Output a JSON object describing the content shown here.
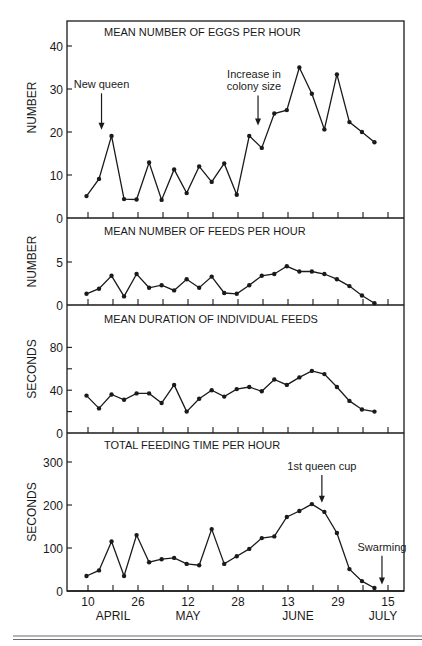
{
  "figure": {
    "bottom_rule_color": "#6b6b6b",
    "ink_color": "#1a1a1a"
  },
  "chart_data": [
    {
      "type": "line",
      "title": "MEAN NUMBER OF EGGS PER HOUR",
      "ylabel": "NUMBER",
      "xlabel": "",
      "ylim": [
        0,
        46
      ],
      "yticks": [
        0,
        10,
        20,
        30,
        40
      ],
      "x_index": [
        0,
        1,
        2,
        3,
        4,
        5,
        6,
        7,
        8,
        9,
        10,
        11,
        12,
        13,
        14,
        15,
        16,
        17,
        18,
        19,
        20,
        21,
        22,
        23
      ],
      "values": [
        5.1,
        9.1,
        19.1,
        4.4,
        4.3,
        12.9,
        4.2,
        11.3,
        5.8,
        12.0,
        8.4,
        12.7,
        5.4,
        19.1,
        16.3,
        24.3,
        25.1,
        35.0,
        28.9,
        20.6,
        33.4,
        22.3,
        20.0,
        17.6
      ],
      "annotations": [
        {
          "text": [
            "New queen"
          ],
          "arrow_at_index": 1.2,
          "arrow_from": 29,
          "arrow_to": 20.5
        },
        {
          "text": [
            "Increase in",
            "colony size"
          ],
          "arrow_at_index": 13.7,
          "arrow_from": 28.5,
          "arrow_to": 21.5
        }
      ]
    },
    {
      "type": "line",
      "title": "MEAN NUMBER OF FEEDS PER HOUR",
      "ylabel": "NUMBER",
      "xlabel": "",
      "ylim": [
        0,
        10
      ],
      "yticks": [
        0,
        5
      ],
      "x_index": [
        0,
        1,
        2,
        3,
        4,
        5,
        6,
        7,
        8,
        9,
        10,
        11,
        12,
        13,
        14,
        15,
        16,
        17,
        18,
        19,
        20,
        21,
        22,
        23
      ],
      "values": [
        1.3,
        1.9,
        3.4,
        1.0,
        3.6,
        2.0,
        2.3,
        1.7,
        3.0,
        2.0,
        3.3,
        1.4,
        1.3,
        2.3,
        3.4,
        3.6,
        4.5,
        3.9,
        3.9,
        3.6,
        3.0,
        2.2,
        1.1,
        0.2
      ],
      "annotations": []
    },
    {
      "type": "line",
      "title": "MEAN DURATION OF INDIVIDUAL FEEDS",
      "ylabel": "SECONDS",
      "xlabel": "",
      "ylim": [
        0,
        120
      ],
      "yticks": [
        0,
        40,
        80
      ],
      "minor_yticks": [
        20,
        60
      ],
      "x_index": [
        0,
        1,
        2,
        3,
        4,
        5,
        6,
        7,
        8,
        9,
        10,
        11,
        12,
        13,
        14,
        15,
        16,
        17,
        18,
        19,
        20,
        21,
        22,
        23
      ],
      "values": [
        35,
        23,
        36,
        31,
        37,
        37,
        28,
        45,
        20,
        32,
        40,
        34,
        41,
        43,
        39,
        50,
        45,
        52,
        58,
        55,
        43,
        30,
        22,
        20
      ],
      "annotations": []
    },
    {
      "type": "line",
      "title": "TOTAL FEEDING TIME PER HOUR",
      "ylabel": "SECONDS",
      "xlabel": "",
      "ylim": [
        0,
        370
      ],
      "yticks": [
        0,
        100,
        200,
        300
      ],
      "x_index": [
        0,
        1,
        2,
        3,
        4,
        5,
        6,
        7,
        8,
        9,
        10,
        11,
        12,
        13,
        14,
        15,
        16,
        17,
        18,
        19,
        20,
        21,
        22,
        23
      ],
      "values": [
        35,
        48,
        115,
        35,
        130,
        67,
        74,
        77,
        63,
        60,
        144,
        63,
        81,
        98,
        123,
        127,
        172,
        186,
        202,
        184,
        135,
        51,
        23,
        7
      ],
      "annotations": [
        {
          "text": [
            "1st queen cup"
          ],
          "arrow_at_index": 18.8,
          "arrow_from": 270,
          "arrow_to": 205
        },
        {
          "text": [
            "Swarming"
          ],
          "arrow_at_index": 23.6,
          "arrow_from": 82,
          "arrow_to": 15
        }
      ]
    }
  ],
  "x_axis": {
    "tick_count": 13,
    "labels": [
      {
        "tick": 0,
        "day": "10",
        "month": "APRIL"
      },
      {
        "tick": 2,
        "day": "26",
        "month": ""
      },
      {
        "tick": 4,
        "day": "12",
        "month": "MAY"
      },
      {
        "tick": 6,
        "day": "28",
        "month": ""
      },
      {
        "tick": 8,
        "day": "13",
        "month": "JUNE"
      },
      {
        "tick": 10,
        "day": "29",
        "month": ""
      },
      {
        "tick": 12,
        "day": "15",
        "month": "JULY"
      }
    ],
    "month_label_offsets": {
      "APRIL": 1,
      "MAY": 4,
      "JUNE": 8.4,
      "JULY": 11.8
    }
  }
}
